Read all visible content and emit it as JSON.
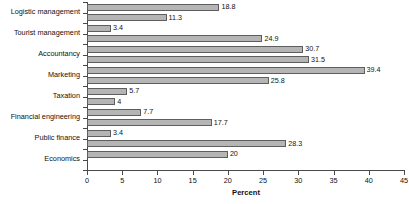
{
  "chart_data": {
    "type": "bar",
    "orientation": "horizontal",
    "title": "",
    "xlabel": "Percent",
    "ylabel": "",
    "xlim": [
      0,
      45
    ],
    "xticks": [
      0,
      5,
      10,
      15,
      20,
      25,
      30,
      35,
      40,
      45
    ],
    "grid": false,
    "legend": "none",
    "categories": [
      "Logistic management",
      "Tourist management",
      "Accountancy",
      "Marketing",
      "Taxation",
      "Financial engineering",
      "Public finance",
      "Economics"
    ],
    "series": [
      {
        "name": "Series 1",
        "values": [
          18.8,
          3.4,
          30.7,
          39.4,
          5.7,
          7.7,
          3.4,
          20
        ]
      },
      {
        "name": "Series 2",
        "values": [
          11.3,
          24.9,
          31.5,
          25.8,
          4,
          17.7,
          28.3,
          null
        ]
      }
    ],
    "bars": [
      {
        "category": "Logistic management",
        "series": "Series 1",
        "value": 18.8,
        "label": "18.8"
      },
      {
        "category": "Logistic management",
        "series": "Series 2",
        "value": 11.3,
        "label": "11.3"
      },
      {
        "category": "Tourist management",
        "series": "Series 1",
        "value": 3.4,
        "label": "3.4"
      },
      {
        "category": "Tourist management",
        "series": "Series 2",
        "value": 24.9,
        "label": "24.9"
      },
      {
        "category": "Accountancy",
        "series": "Series 1",
        "value": 30.7,
        "label": "30.7"
      },
      {
        "category": "Accountancy",
        "series": "Series 2",
        "value": 31.5,
        "label": "31.5"
      },
      {
        "category": "Marketing",
        "series": "Series 1",
        "value": 39.4,
        "label": "39.4"
      },
      {
        "category": "Marketing",
        "series": "Series 2",
        "value": 25.8,
        "label": "25.8"
      },
      {
        "category": "Taxation",
        "series": "Series 1",
        "value": 5.7,
        "label": "5.7"
      },
      {
        "category": "Taxation",
        "series": "Series 2",
        "value": 4,
        "label": "4"
      },
      {
        "category": "Financial engineering",
        "series": "Series 1",
        "value": 7.7,
        "label": "7.7"
      },
      {
        "category": "Financial engineering",
        "series": "Series 2",
        "value": 17.7,
        "label": "17.7"
      },
      {
        "category": "Public finance",
        "series": "Series 1",
        "value": 3.4,
        "label": "3.4"
      },
      {
        "category": "Public finance",
        "series": "Series 2",
        "value": 28.3,
        "label": "28.3"
      },
      {
        "category": "Economics",
        "series": "Series 1",
        "value": 20,
        "label": "20"
      }
    ],
    "colors": {
      "bar_fill": "#b5b5b5",
      "bar_border": "#5e5e5e",
      "axis": "#4a4a4a",
      "text": "#111111",
      "background": "#ffffff"
    }
  }
}
